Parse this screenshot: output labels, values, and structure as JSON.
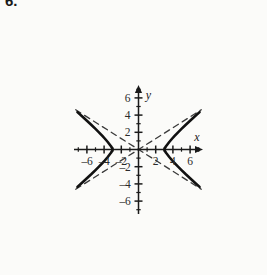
{
  "figure": {
    "exercise_number": "6.",
    "background_color": "#fbfbf9",
    "ink_color": "#1a1a1a"
  },
  "chart_data": {
    "type": "line",
    "title": "",
    "subtitle": "",
    "xlabel": "x",
    "ylabel": "y",
    "xlim": [
      -7.5,
      7.5
    ],
    "ylim": [
      -7.5,
      7.5
    ],
    "grid": false,
    "legend": null,
    "axis_style": "arrowed-cartesian",
    "x_ticks": [
      -7,
      -6,
      -5,
      -4,
      -3,
      -2,
      -1,
      1,
      2,
      3,
      4,
      5,
      6,
      7
    ],
    "y_ticks": [
      -7,
      -6,
      -5,
      -4,
      -3,
      -2,
      -1,
      1,
      2,
      3,
      4,
      5,
      6,
      7
    ],
    "x_tick_labels": [
      {
        "value": -6,
        "text": "–6"
      },
      {
        "value": -4,
        "text": "–4"
      },
      {
        "value": -2,
        "text": "–2"
      },
      {
        "value": 2,
        "text": "2"
      },
      {
        "value": 4,
        "text": "4"
      },
      {
        "value": 6,
        "text": "6"
      }
    ],
    "y_tick_labels": [
      {
        "value": 6,
        "text": "6"
      },
      {
        "value": 4,
        "text": "4"
      },
      {
        "value": 2,
        "text": "2"
      },
      {
        "value": -2,
        "text": "–2"
      },
      {
        "value": -4,
        "text": "–4"
      },
      {
        "value": -6,
        "text": "–6"
      }
    ],
    "series": [
      {
        "name": "hyperbola-right-branch",
        "style": "solid",
        "color": "#111111",
        "width": 2.6,
        "points": [
          [
            7.1,
            4.35
          ],
          [
            6.5,
            3.8
          ],
          [
            6.0,
            3.34
          ],
          [
            5.5,
            2.88
          ],
          [
            5.0,
            2.4
          ],
          [
            4.6,
            2.0
          ],
          [
            4.2,
            1.58
          ],
          [
            3.9,
            1.25
          ],
          [
            3.6,
            0.9
          ],
          [
            3.4,
            0.64
          ],
          [
            3.2,
            0.38
          ],
          [
            3.05,
            0.14
          ],
          [
            3.0,
            0.0
          ],
          [
            3.05,
            -0.14
          ],
          [
            3.2,
            -0.38
          ],
          [
            3.4,
            -0.64
          ],
          [
            3.6,
            -0.9
          ],
          [
            3.9,
            -1.25
          ],
          [
            4.2,
            -1.58
          ],
          [
            4.6,
            -2.0
          ],
          [
            5.0,
            -2.4
          ],
          [
            5.5,
            -2.88
          ],
          [
            6.0,
            -3.34
          ],
          [
            6.5,
            -3.8
          ],
          [
            7.1,
            -4.35
          ]
        ]
      },
      {
        "name": "hyperbola-left-branch",
        "style": "solid",
        "color": "#111111",
        "width": 2.6,
        "points": [
          [
            -7.1,
            4.35
          ],
          [
            -6.5,
            3.8
          ],
          [
            -6.0,
            3.34
          ],
          [
            -5.5,
            2.88
          ],
          [
            -5.0,
            2.4
          ],
          [
            -4.6,
            2.0
          ],
          [
            -4.2,
            1.58
          ],
          [
            -3.9,
            1.25
          ],
          [
            -3.6,
            0.9
          ],
          [
            -3.4,
            0.64
          ],
          [
            -3.2,
            0.38
          ],
          [
            -3.05,
            0.14
          ],
          [
            -3.0,
            0.0
          ],
          [
            -3.05,
            -0.14
          ],
          [
            -3.2,
            -0.38
          ],
          [
            -3.4,
            -0.64
          ],
          [
            -3.6,
            -0.9
          ],
          [
            -3.9,
            -1.25
          ],
          [
            -4.2,
            -1.58
          ],
          [
            -4.6,
            -2.0
          ],
          [
            -5.0,
            -2.4
          ],
          [
            -5.5,
            -2.88
          ],
          [
            -6.0,
            -3.34
          ],
          [
            -6.5,
            -3.8
          ],
          [
            -7.1,
            -4.35
          ]
        ]
      },
      {
        "name": "asymptote-positive-slope",
        "style": "dashed",
        "color": "#3a3a3a",
        "width": 1.3,
        "points": [
          [
            -7.3,
            -4.62
          ],
          [
            7.3,
            4.62
          ]
        ]
      },
      {
        "name": "asymptote-negative-slope",
        "style": "dashed",
        "color": "#3a3a3a",
        "width": 1.3,
        "points": [
          [
            -7.3,
            4.62
          ],
          [
            7.3,
            -4.62
          ]
        ]
      }
    ],
    "annotations": [
      {
        "name": "vertex-right",
        "x": 3,
        "y": 0,
        "text": ""
      },
      {
        "name": "vertex-left",
        "x": -3,
        "y": 0,
        "text": ""
      }
    ]
  }
}
